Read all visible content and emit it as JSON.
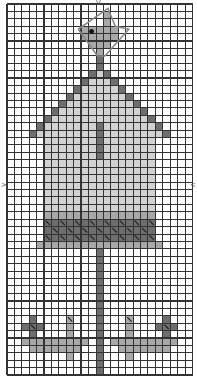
{
  "chart": {
    "columns": 25,
    "rows": 50,
    "cell_size": 7.42,
    "colors": {
      "background": "#ffffff",
      "grid": "#333333",
      "dark": "#6e6e6e",
      "medium": "#a8a8a8",
      "light": "#d2d2d2",
      "eye": "#111111"
    },
    "center_markers": {
      "top": "V",
      "bottom": "Λ",
      "left": ">",
      "right": "<"
    },
    "regions": [
      {
        "name": "bird-body",
        "color": "medium",
        "cells": [
          [
            10,
            3
          ],
          [
            11,
            3
          ],
          [
            12,
            3
          ],
          [
            13,
            3
          ],
          [
            10,
            4
          ],
          [
            11,
            4
          ],
          [
            12,
            4
          ],
          [
            13,
            4
          ],
          [
            14,
            4
          ],
          [
            11,
            5
          ],
          [
            12,
            5
          ],
          [
            13,
            5
          ],
          [
            12,
            6
          ],
          [
            13,
            2
          ],
          [
            13,
            1
          ],
          [
            14,
            3
          ]
        ]
      },
      {
        "name": "roof-peak-post",
        "color": "dark",
        "cells": [
          [
            12,
            7
          ],
          [
            12,
            8
          ]
        ]
      },
      {
        "name": "roof-left",
        "color": "dark",
        "rows": [
          [
            9,
            11,
            11
          ],
          [
            10,
            10,
            10
          ],
          [
            11,
            9,
            9
          ],
          [
            12,
            8,
            8
          ],
          [
            13,
            7,
            7
          ],
          [
            14,
            6,
            6
          ],
          [
            15,
            5,
            5
          ],
          [
            16,
            4,
            4
          ],
          [
            17,
            3,
            3
          ]
        ]
      },
      {
        "name": "roof-right",
        "color": "dark",
        "rows": [
          [
            9,
            13,
            13
          ],
          [
            10,
            14,
            14
          ],
          [
            11,
            15,
            15
          ],
          [
            12,
            16,
            16
          ],
          [
            13,
            17,
            17
          ],
          [
            14,
            18,
            18
          ],
          [
            15,
            19,
            19
          ],
          [
            16,
            20,
            20
          ],
          [
            17,
            21,
            21
          ]
        ]
      },
      {
        "name": "roof-inner",
        "color": "light",
        "rows": [
          [
            9,
            12,
            12
          ],
          [
            10,
            11,
            13
          ],
          [
            11,
            10,
            14
          ],
          [
            12,
            9,
            15
          ],
          [
            13,
            8,
            16
          ],
          [
            14,
            7,
            17
          ],
          [
            15,
            6,
            18
          ],
          [
            16,
            5,
            19
          ],
          [
            17,
            4,
            20
          ]
        ]
      },
      {
        "name": "house-body",
        "color": "light",
        "rows": [
          [
            18,
            5,
            19
          ],
          [
            19,
            5,
            19
          ],
          [
            20,
            5,
            19
          ],
          [
            21,
            5,
            19
          ],
          [
            22,
            5,
            19
          ],
          [
            23,
            5,
            19
          ],
          [
            24,
            5,
            19
          ],
          [
            25,
            5,
            19
          ],
          [
            26,
            5,
            19
          ],
          [
            27,
            5,
            19
          ]
        ]
      },
      {
        "name": "center-post",
        "color": "dark",
        "rows": [
          [
            16,
            12,
            12
          ],
          [
            17,
            12,
            12
          ],
          [
            18,
            12,
            12
          ],
          [
            19,
            12,
            12
          ],
          [
            20,
            12,
            12
          ]
        ]
      },
      {
        "name": "band-top-edge",
        "color": "medium",
        "rows": [
          [
            28,
            5,
            19
          ]
        ]
      },
      {
        "name": "band",
        "color": "dark",
        "rows": [
          [
            29,
            5,
            19
          ],
          [
            30,
            5,
            19
          ],
          [
            31,
            5,
            19
          ]
        ]
      },
      {
        "name": "band-bottom-edge",
        "color": "medium",
        "rows": [
          [
            32,
            4,
            20
          ]
        ]
      },
      {
        "name": "pole",
        "color": "dark",
        "rows": [
          [
            33,
            12,
            12
          ],
          [
            34,
            12,
            12
          ],
          [
            35,
            12,
            12
          ],
          [
            36,
            12,
            12
          ],
          [
            37,
            12,
            12
          ],
          [
            38,
            12,
            12
          ],
          [
            39,
            12,
            12
          ],
          [
            40,
            12,
            12
          ],
          [
            41,
            12,
            12
          ],
          [
            42,
            12,
            12
          ],
          [
            43,
            12,
            12
          ],
          [
            44,
            12,
            12
          ],
          [
            45,
            12,
            12
          ],
          [
            46,
            12,
            12
          ],
          [
            47,
            12,
            12
          ],
          [
            48,
            12,
            12
          ],
          [
            49,
            12,
            12
          ]
        ]
      },
      {
        "name": "flower-1",
        "color": "dark",
        "cells": [
          [
            3,
            42
          ],
          [
            2,
            43
          ],
          [
            3,
            43
          ],
          [
            4,
            43
          ],
          [
            3,
            44
          ]
        ]
      },
      {
        "name": "flower-2",
        "color": "medium",
        "cells": [
          [
            8,
            42
          ],
          [
            8,
            43
          ],
          [
            8,
            44
          ]
        ]
      },
      {
        "name": "flower-3",
        "color": "medium",
        "cells": [
          [
            16,
            42
          ],
          [
            16,
            43
          ],
          [
            16,
            44
          ]
        ]
      },
      {
        "name": "flower-4",
        "color": "dark",
        "cells": [
          [
            21,
            42
          ],
          [
            20,
            43
          ],
          [
            21,
            43
          ],
          [
            22,
            43
          ],
          [
            21,
            44
          ]
        ]
      },
      {
        "name": "stems-left",
        "color": "medium",
        "rows": [
          [
            45,
            2,
            10
          ],
          [
            46,
            3,
            9
          ],
          [
            47,
            8,
            8
          ]
        ]
      },
      {
        "name": "stems-right",
        "color": "medium",
        "rows": [
          [
            45,
            14,
            22
          ],
          [
            46,
            15,
            21
          ],
          [
            47,
            16,
            16
          ]
        ]
      }
    ],
    "diagonal_stitches": [
      [
        5,
        29
      ],
      [
        7,
        29
      ],
      [
        9,
        29
      ],
      [
        11,
        29
      ],
      [
        13,
        29
      ],
      [
        15,
        29
      ],
      [
        17,
        29
      ],
      [
        19,
        29
      ],
      [
        6,
        30
      ],
      [
        8,
        30
      ],
      [
        10,
        30
      ],
      [
        12,
        30
      ],
      [
        14,
        30
      ],
      [
        16,
        30
      ],
      [
        18,
        30
      ],
      [
        5,
        31
      ],
      [
        7,
        31
      ],
      [
        9,
        31
      ],
      [
        11,
        31
      ],
      [
        13,
        31
      ],
      [
        15,
        31
      ],
      [
        17,
        31
      ],
      [
        19,
        31
      ],
      [
        3,
        43
      ],
      [
        8,
        42
      ],
      [
        16,
        42
      ],
      [
        21,
        43
      ]
    ],
    "eye": [
      11,
      4
    ]
  }
}
